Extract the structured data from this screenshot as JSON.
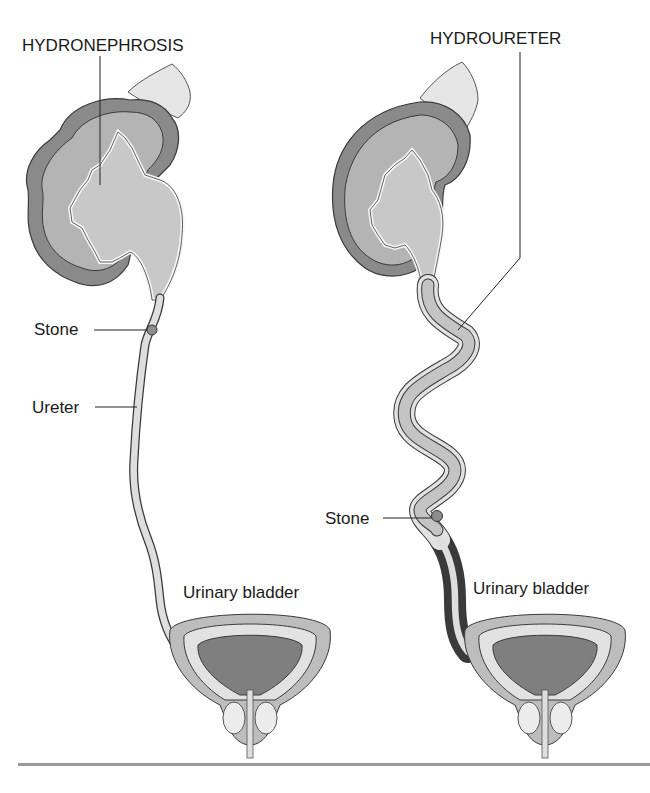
{
  "figure": {
    "left_panel": {
      "condition_label": "HYDRONEPHROSIS",
      "stone_label": "Stone",
      "ureter_label": "Ureter",
      "bladder_label": "Urinary bladder"
    },
    "right_panel": {
      "condition_label": "HYDROURETER",
      "stone_label": "Stone",
      "bladder_label": "Urinary bladder"
    }
  },
  "colors": {
    "kidney_capsule": "#8a8a8a",
    "kidney_cortex": "#b4b4b4",
    "pelvis_fill": "#c8c8c8",
    "adrenal": "#e6e6e6",
    "ureter_fill": "#dedede",
    "bladder_outer": "#bdbdbd",
    "bladder_inner": "#e2e2e2",
    "bladder_lumen": "#7f7f7f",
    "outline": "#3a3a3a",
    "rule": "#9a9a9a"
  }
}
